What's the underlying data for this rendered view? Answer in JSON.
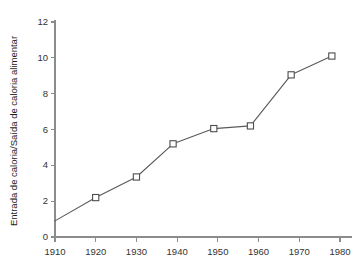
{
  "chart_data": {
    "type": "line",
    "title": "",
    "xlabel": "",
    "ylabel": "Entrada de caloria/Saída de caloria alimentar",
    "xlim": [
      1910,
      1980
    ],
    "ylim": [
      0,
      12
    ],
    "grid": false,
    "legend": "none",
    "xticks": [
      1910,
      1920,
      1930,
      1940,
      1950,
      1960,
      1970,
      1980
    ],
    "xtick_labels": [
      "1910",
      "1920",
      "1930",
      "1940",
      "1950",
      "1960",
      "1970",
      "1980"
    ],
    "yticks": [
      0,
      2,
      4,
      6,
      8,
      10,
      12
    ],
    "ytick_labels": [
      "0",
      "2",
      "4",
      "6",
      "8",
      "10",
      "12"
    ],
    "series": [
      {
        "name": "Entrada de caloria/Saída de caloria alimentar",
        "marker": "square-open",
        "x": [
          1910,
          1920,
          1930,
          1939,
          1949,
          1958,
          1968,
          1978
        ],
        "y": [
          0.9,
          2.2,
          3.35,
          5.2,
          6.05,
          6.2,
          9.05,
          10.1
        ],
        "markers_shown": [
          false,
          true,
          true,
          true,
          true,
          true,
          true,
          true
        ]
      }
    ],
    "colors": {
      "line": "#595959",
      "marker_fill": "#ffffff",
      "marker_stroke": "#4d4d4d",
      "axis": "#8c8c8c",
      "text": "#333333",
      "background": "#ffffff"
    }
  }
}
